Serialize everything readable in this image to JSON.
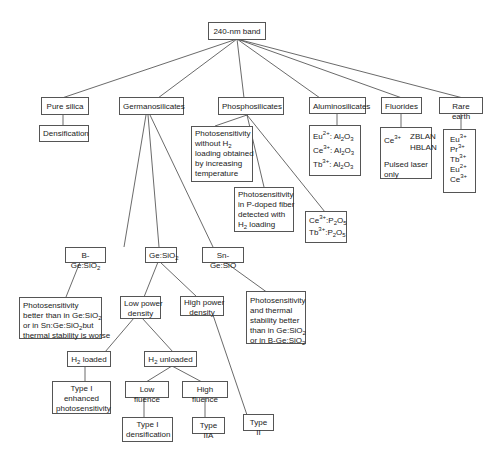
{
  "root": {
    "label": "240-nm band"
  },
  "categories": [
    {
      "label": "Pure silica"
    },
    {
      "label": "Germanosilicates"
    },
    {
      "label": "Phosphosilicates"
    },
    {
      "label": "Aluminosilicates"
    },
    {
      "label": "Fluorides"
    },
    {
      "label": "Rare earth"
    }
  ],
  "pure_silica": {
    "child": "Densification"
  },
  "phosphosilicates": {
    "note1": [
      "Photosensitivity",
      "without H",
      "2",
      "loading obtained",
      "by increasing",
      "temperature"
    ],
    "note2": [
      "Photosensitivity",
      "in P-doped fiber",
      "detected with",
      "H",
      "2",
      " loading"
    ],
    "ions": [
      {
        "ion": "Ce",
        "charge": "3+",
        "host": ":P",
        "s1": "2",
        "mid": "O",
        "s2": "5"
      },
      {
        "ion": "Tb",
        "charge": "3+",
        "host": ":P",
        "s1": "2",
        "mid": "O",
        "s2": "5"
      }
    ]
  },
  "aluminosilicates": {
    "ions": [
      {
        "ion": "Eu",
        "charge": "2+",
        "host": ": Al",
        "s1": "2",
        "mid": "O",
        "s2": "3"
      },
      {
        "ion": "Ce",
        "charge": "3+",
        "host": ": Al",
        "s1": "2",
        "mid": "O",
        "s2": "3"
      },
      {
        "ion": "Tb",
        "charge": "3+",
        "host": ": Al",
        "s1": "2",
        "mid": "O",
        "s2": "3"
      }
    ]
  },
  "fluorides": {
    "ion": "Ce",
    "charge": "3+",
    "hosts": [
      "ZBLAN",
      "HBLAN"
    ],
    "note": [
      "Pulsed laser",
      "only"
    ]
  },
  "rare_earth": {
    "ions": [
      {
        "ion": "Eu",
        "charge": "3+"
      },
      {
        "ion": "Pr",
        "charge": "3+"
      },
      {
        "ion": "Tb",
        "charge": "3+"
      },
      {
        "ion": "Eu",
        "charge": "2+"
      },
      {
        "ion": "Ce",
        "charge": "3+"
      }
    ]
  },
  "germanosilicates": {
    "b_ge": {
      "label": "B-Ge:SiO",
      "sub": "2",
      "note": [
        "Photosensitivity",
        "better than in Ge:SiO",
        "2",
        "or in Sn:Ge:SiO",
        "2",
        "but",
        "thermal stability is worse"
      ]
    },
    "ge": {
      "label": "Ge:SiO",
      "sub": "2"
    },
    "sn_ge": {
      "label": "Sn-Ge:SiO",
      "note": [
        "Photosensitivity",
        "and thermal",
        "stability better",
        "than in Ge:SiO",
        "2",
        "or in B-Ge:SiO",
        "2"
      ]
    },
    "low_power": [
      "Low power",
      "density"
    ],
    "high_power": [
      "High power",
      "density"
    ],
    "h2_loaded": {
      "pre": "H",
      "sub": "2",
      "post": " loaded"
    },
    "h2_unloaded": {
      "pre": "H",
      "sub": "2",
      "post": " unloaded"
    },
    "type1_enhanced": [
      "Type I",
      "enhanced",
      "photosensitivity"
    ],
    "low_fluence": "Low fluence",
    "high_fluence": "High fluence",
    "type1_densification": [
      "Type I",
      "densification"
    ],
    "type_iia": "Type IIA",
    "type_ii": "Type II"
  }
}
